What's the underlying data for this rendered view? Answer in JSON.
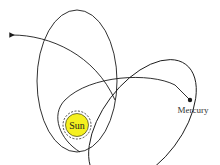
{
  "diagram": {
    "sun": {
      "label": "Sun",
      "color": "#f5f020",
      "ray_color": "#1a1a1a"
    },
    "planet": {
      "label": "Mercury",
      "color": "#1a1a1a"
    },
    "orbit_color": "#1a1a1a",
    "orbits": 3
  }
}
